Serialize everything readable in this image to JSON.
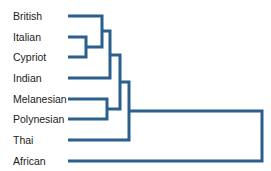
{
  "diagram": {
    "type": "dendrogram",
    "line_color": "#2b5f8e",
    "leaves": [
      {
        "label": "British",
        "y": 16
      },
      {
        "label": "Italian",
        "y": 37
      },
      {
        "label": "Cypriot",
        "y": 57
      },
      {
        "label": "Indian",
        "y": 78
      },
      {
        "label": "Melanesian",
        "y": 99
      },
      {
        "label": "Polynesian",
        "y": 119
      },
      {
        "label": "Thai",
        "y": 140
      },
      {
        "label": "African",
        "y": 161
      }
    ],
    "clusters": [
      {
        "members": [
          "Italian",
          "Cypriot"
        ],
        "join_x": 86
      },
      {
        "members": [
          "British",
          "Italian",
          "Cypriot"
        ],
        "join_x": 102
      },
      {
        "members": [
          "British",
          "Italian",
          "Cypriot",
          "Indian"
        ],
        "join_x": 110
      },
      {
        "members": [
          "Melanesian",
          "Polynesian"
        ],
        "join_x": 107
      },
      {
        "members": [
          "British",
          "Italian",
          "Cypriot",
          "Indian",
          "Melanesian",
          "Polynesian"
        ],
        "join_x": 120
      },
      {
        "members": [
          "British",
          "Italian",
          "Cypriot",
          "Indian",
          "Melanesian",
          "Polynesian",
          "Thai"
        ],
        "join_x": 129
      },
      {
        "members": [
          "British",
          "Italian",
          "Cypriot",
          "Indian",
          "Melanesian",
          "Polynesian",
          "Thai",
          "African"
        ],
        "join_x": 262
      }
    ]
  }
}
